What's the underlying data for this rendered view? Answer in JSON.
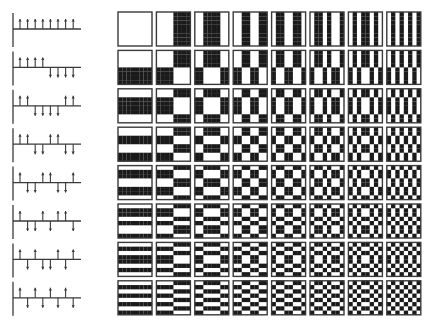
{
  "figure": {
    "order": "sequency",
    "size": 8,
    "colors": {
      "positive": "#ffffff",
      "negative": "#1a1a1a",
      "stroke": "#3a3a3a"
    },
    "walsh_functions": [
      [
        1,
        1,
        1,
        1,
        1,
        1,
        1,
        1
      ],
      [
        1,
        1,
        1,
        1,
        -1,
        -1,
        -1,
        -1
      ],
      [
        1,
        1,
        -1,
        -1,
        -1,
        -1,
        1,
        1
      ],
      [
        1,
        1,
        -1,
        -1,
        1,
        1,
        -1,
        -1
      ],
      [
        1,
        -1,
        -1,
        1,
        1,
        -1,
        -1,
        1
      ],
      [
        1,
        -1,
        -1,
        1,
        -1,
        1,
        1,
        -1
      ],
      [
        1,
        -1,
        1,
        -1,
        -1,
        1,
        -1,
        1
      ],
      [
        1,
        -1,
        1,
        -1,
        1,
        -1,
        1,
        -1
      ]
    ]
  }
}
